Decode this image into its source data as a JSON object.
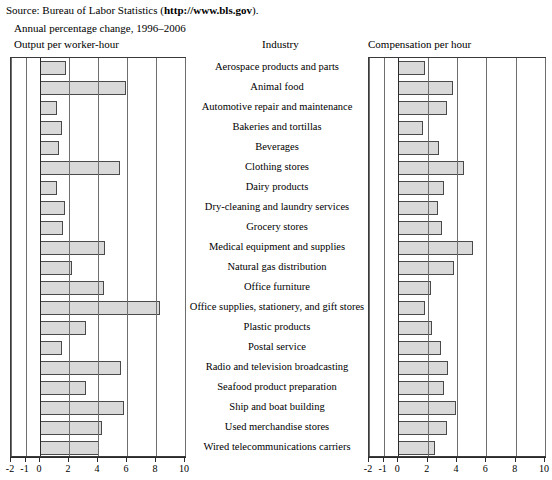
{
  "source": {
    "prefix": "Source: Bureau of Labor Statistics (",
    "url": "http://www.bls.gov",
    "suffix": ").",
    "full": "Source: Bureau of Labor Statistics (http://www.bls.gov)."
  },
  "subtitle": "Annual percentage change, 1996–2006",
  "titles": {
    "left": "Output per worker-hour",
    "center": "Industry",
    "right": "Compensation per hour"
  },
  "axis": {
    "ticks": [
      "-2",
      "-1",
      "0",
      "2",
      "4",
      "6",
      "8",
      "10"
    ],
    "tick_values": [
      -2,
      -1,
      0,
      2,
      4,
      6,
      8,
      10
    ],
    "min": -2,
    "max": 10
  },
  "colors": {
    "bar_fill": "#d9d9d9",
    "bar_border": "#4a4a4a",
    "frame": "#3a3a3a",
    "grid": "#6e6e6e",
    "text": "#000000"
  },
  "chart_data": {
    "type": "bar",
    "title": "Annual percentage change, 1996–2006",
    "orientation": "horizontal",
    "grid": true,
    "legend": "none",
    "xlabel": "",
    "ylabel": "Industry",
    "xlim": [
      -2,
      10
    ],
    "categories": [
      "Aerospace products and parts",
      "Animal food",
      "Automotive repair and maintenance",
      "Bakeries and tortillas",
      "Beverages",
      "Clothing stores",
      "Dairy products",
      "Dry-cleaning and laundry services",
      "Grocery stores",
      "Medical equipment and supplies",
      "Natural gas distribution",
      "Office furniture",
      "Office supplies, stationery, and gift stores",
      "Plastic products",
      "Postal service",
      "Radio and television broadcasting",
      "Seafood product preparation",
      "Ship and boat building",
      "Used merchandise stores",
      "Wired telecommunications carriers"
    ],
    "series": [
      {
        "name": "Output per worker-hour",
        "values": [
          1.8,
          5.9,
          1.2,
          1.5,
          1.3,
          5.5,
          1.2,
          1.7,
          1.6,
          4.5,
          2.2,
          4.4,
          8.3,
          3.2,
          1.5,
          5.6,
          3.2,
          5.8,
          4.3,
          4.1
        ]
      },
      {
        "name": "Compensation per hour",
        "values": [
          1.8,
          3.7,
          3.3,
          1.7,
          2.8,
          4.5,
          3.1,
          2.7,
          3.0,
          5.1,
          3.8,
          2.2,
          1.8,
          2.3,
          2.9,
          3.4,
          3.1,
          3.9,
          3.3,
          2.5
        ]
      }
    ]
  }
}
